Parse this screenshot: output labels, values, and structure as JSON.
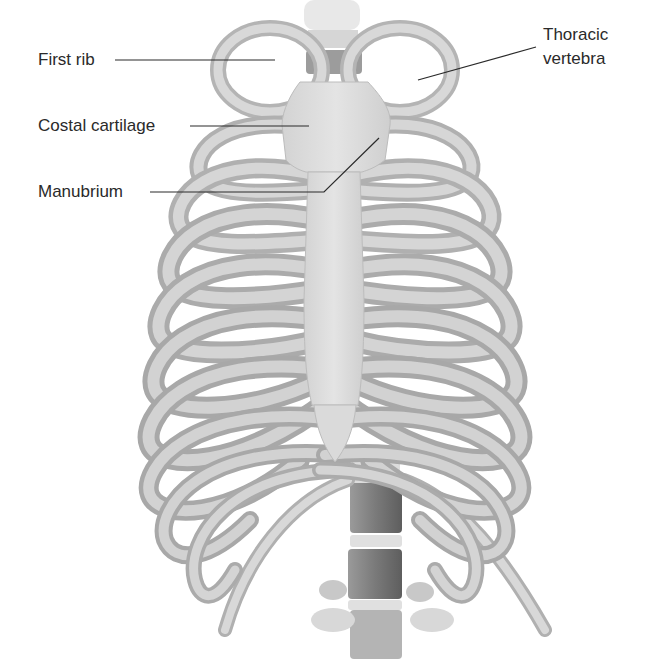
{
  "figure": {
    "style": "grayscale pencil anatomical illustration",
    "colors": {
      "background": "#ffffff",
      "bone_light": "#e6e6e6",
      "bone_mid": "#bdbdbd",
      "bone_dark": "#8c8c8c",
      "vertebra_dark": "#6f6f6f",
      "leader_line": "#2a2a2a",
      "label_text": "#2a2a2a"
    }
  },
  "labels": {
    "first_rib": "First rib",
    "costal_cartilage": "Costal cartilage",
    "manubrium": "Manubrium",
    "thoracic_vertebra_line1": "Thoracic",
    "thoracic_vertebra_line2": "vertebra"
  }
}
